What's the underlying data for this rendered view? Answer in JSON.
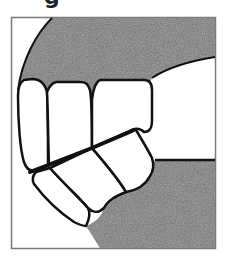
{
  "figure": {
    "title_fragment": "g",
    "colors": {
      "background": "#ffffff",
      "frame": "#7a7a7a",
      "gum_fill": "#707070",
      "outline": "#111111",
      "tooth_fill": "#ffffff"
    },
    "regions": {
      "upper_gum": "upper gingiva",
      "lower_gum": "lower gingiva",
      "upper_teeth": [
        "upper tooth 1",
        "upper tooth 2",
        "upper tooth 3"
      ],
      "lower_teeth": [
        "lower tooth 1",
        "lower tooth 2",
        "lower tooth 3"
      ]
    }
  }
}
